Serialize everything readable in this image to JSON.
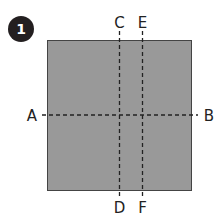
{
  "step": {
    "number": "1",
    "badge_color": "#231f20"
  },
  "square": {
    "fill": "#999999",
    "border": "#444444"
  },
  "fold_lines": {
    "horizontal": {
      "start_label": "A",
      "end_label": "B"
    },
    "vertical_1": {
      "start_label": "C",
      "end_label": "D"
    },
    "vertical_2": {
      "start_label": "E",
      "end_label": "F"
    }
  }
}
